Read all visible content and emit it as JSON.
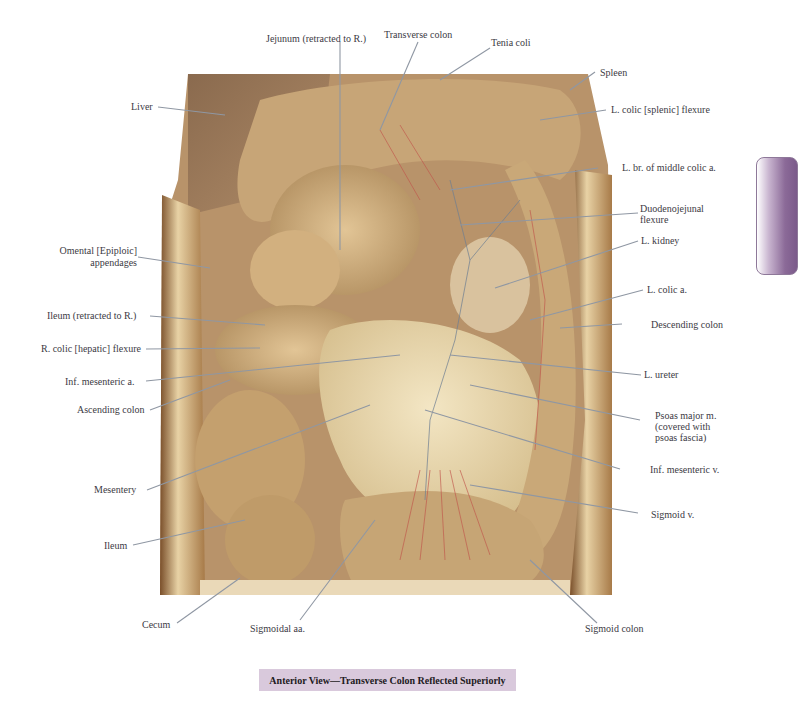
{
  "figure": {
    "caption": "Anterior View—Transverse Colon Reflected Superiorly",
    "accent_colors": {
      "caption_bg": "#d9c9dc",
      "tab": "#7b5a8a",
      "leader_line": "#8f97a3"
    }
  },
  "labels": {
    "jejunum": "Jejunum (retracted to R.)",
    "transverse_colon": "Transverse colon",
    "tenia_coli": "Tenia coli",
    "spleen": "Spleen",
    "l_colic_flexure": "L. colic [splenic] flexure",
    "liver": "Liver",
    "l_br_middle_colic": "L. br. of middle colic a.",
    "duodenojejunal_1": "Duodenojejunal",
    "duodenojejunal_2": "flexure",
    "omental_1": "Omental [Epiploic]",
    "omental_2": "appendages",
    "l_kidney": "L. kidney",
    "l_colic_a": "L. colic a.",
    "ileum_retracted": "Ileum (retracted to R.)",
    "descending_colon": "Descending colon",
    "r_colic_flexure": "R. colic [hepatic] flexure",
    "inf_mesenteric_a": "Inf. mesenteric a.",
    "l_ureter": "L. ureter",
    "ascending_colon": "Ascending colon",
    "psoas_1": "Psoas major m.",
    "psoas_2": "(covered with",
    "psoas_3": "psoas fascia)",
    "inf_mesenteric_v": "Inf. mesenteric v.",
    "mesentery": "Mesentery",
    "sigmoid_v": "Sigmoid v.",
    "ileum": "Ileum",
    "cecum": "Cecum",
    "sigmoidal_aa": "Sigmoidal aa.",
    "sigmoid_colon": "Sigmoid colon"
  }
}
